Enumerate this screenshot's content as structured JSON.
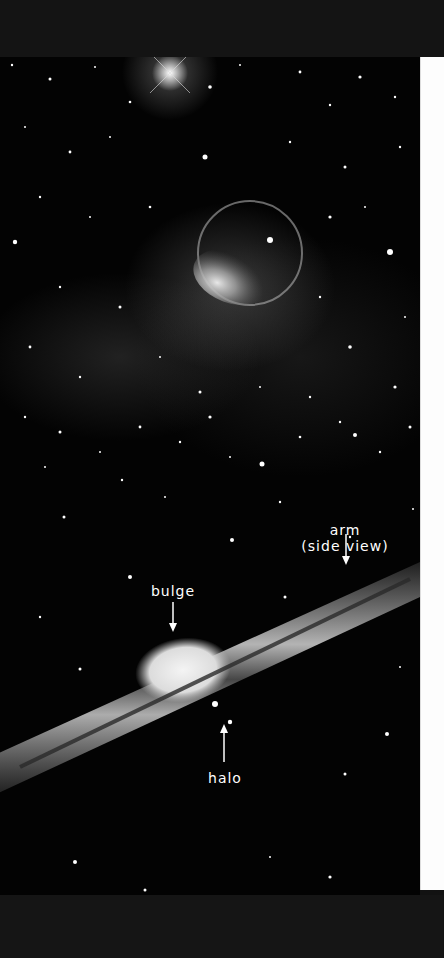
{
  "figure": {
    "top_panel": {
      "subject": "star field with bubble nebula",
      "bright_star": {
        "x": 170,
        "y": 73
      },
      "nebula_shell": {
        "cx": 250,
        "cy": 253,
        "r": 52
      }
    },
    "bottom_panel": {
      "subject": "edge-on spiral galaxy",
      "labels": {
        "arm_line1": "arm",
        "arm_line2": "(side view)",
        "bulge": "bulge",
        "halo": "halo"
      }
    }
  },
  "colors": {
    "background": "#030303",
    "page_edge": "#fdfdfd",
    "label_text": "#ffffff",
    "scan_border": "#141414"
  }
}
